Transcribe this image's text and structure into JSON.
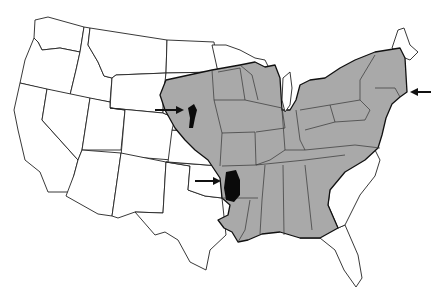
{
  "map": {
    "subject": "United States outline map with shaded eastern distribution range",
    "colors": {
      "background": "#ffffff",
      "range_fill": "#a9a9a9",
      "patch_fill": "#0a0a0a",
      "outline": "#222222"
    },
    "regions": [
      {
        "name": "shaded-range",
        "description": "Eastern and central United States from the Great Plains to the Atlantic coast, excluding Florida and coastal Carolinas/Georgia"
      },
      {
        "name": "black-patch-nebraska",
        "description": "Isolated dark patch in Nebraska"
      },
      {
        "name": "black-patch-oklahoma-arkansas",
        "description": "Isolated dark patch near Oklahoma/Arkansas border"
      }
    ],
    "arrows": [
      {
        "name": "arrow-nebraska",
        "direction": "right",
        "target": "black-patch-nebraska"
      },
      {
        "name": "arrow-oklahoma",
        "direction": "right",
        "target": "black-patch-oklahoma-arkansas"
      },
      {
        "name": "arrow-new-england",
        "direction": "left",
        "target": "Massachusetts coast"
      }
    ]
  }
}
